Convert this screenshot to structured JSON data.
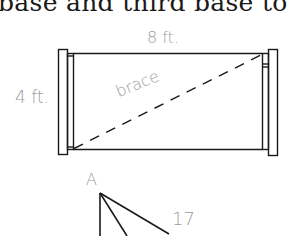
{
  "page": {
    "top_text": "base and third base to the"
  },
  "gate_figure": {
    "width_label": "8 ft.",
    "height_label": "4 ft.",
    "brace_label": "brace"
  },
  "triangle_figure": {
    "vertex_label": "A",
    "side_label": "17"
  },
  "colors": {
    "line": "#1a1a1a",
    "label": "#9a9a9a"
  }
}
